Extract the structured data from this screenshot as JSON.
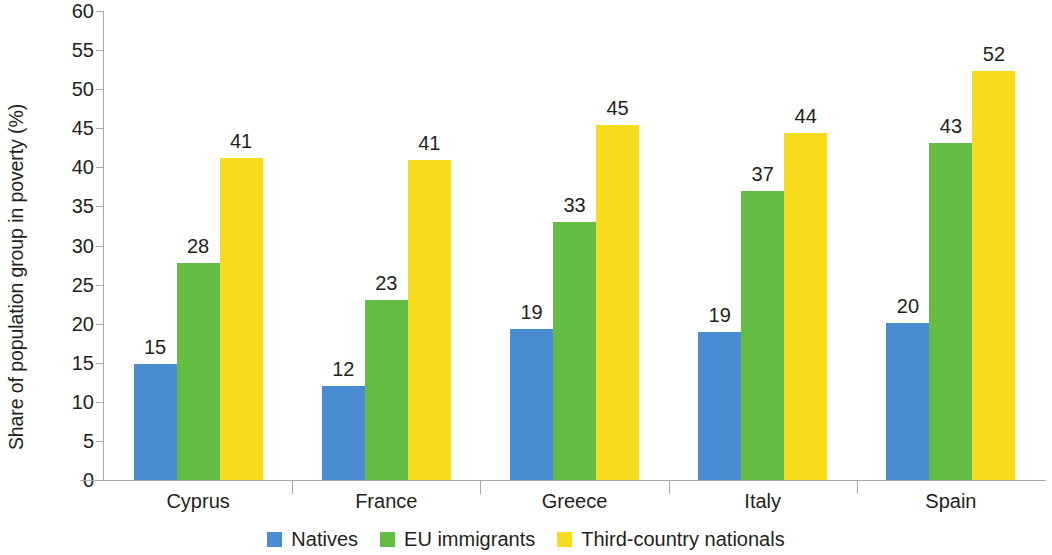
{
  "chart_data": {
    "type": "bar",
    "title": "",
    "subtitle": "",
    "xlabel": "",
    "ylabel": "Share of population group in poverty (%)",
    "categories": [
      "Cyprus",
      "France",
      "Greece",
      "Italy",
      "Spain"
    ],
    "series": [
      {
        "name": "Natives",
        "color": "#4a8cd2",
        "values": [
          15,
          12,
          19,
          19,
          20
        ],
        "plot_values": [
          14.9,
          12.0,
          19.3,
          18.9,
          20.1
        ]
      },
      {
        "name": "EU immigrants",
        "color": "#63bd42",
        "values": [
          28,
          23,
          33,
          37,
          43
        ],
        "plot_values": [
          27.8,
          23.0,
          33.0,
          37.0,
          43.1
        ]
      },
      {
        "name": "Third-country nationals",
        "color": "#f7dc1e",
        "values": [
          41,
          41,
          45,
          44,
          52
        ],
        "plot_values": [
          41.2,
          41.0,
          45.4,
          44.4,
          52.3
        ]
      }
    ],
    "ylim": [
      0,
      60
    ],
    "ytick_step": 5,
    "yticks": [
      0,
      5,
      10,
      15,
      20,
      25,
      30,
      35,
      40,
      45,
      50,
      55,
      60
    ],
    "ytick_labels": [
      "0",
      "5",
      "10",
      "15",
      "20",
      "25",
      "30",
      "35",
      "40",
      "45",
      "50",
      "55",
      "60"
    ],
    "grid": false,
    "legend_position": "bottom-center",
    "bar_labels_shown": true,
    "axis_color": "#a7a9ac",
    "text_color": "#231f20",
    "background": "#ffffff"
  }
}
